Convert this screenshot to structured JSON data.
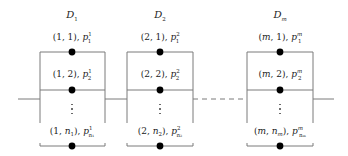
{
  "diagram": {
    "type": "parallel-series system",
    "line_color": "#7a7a7a",
    "node_color": "#000000",
    "connector_between_2_and_m": "dashed",
    "groups": [
      {
        "title": "D",
        "title_sub": "1",
        "center_x": 72,
        "left_x": 40,
        "right_x": 105,
        "rows": [
          {
            "pre": "(1, 1), ",
            "p": "p",
            "sup": "1",
            "sub": "1"
          },
          {
            "pre": "(1, 2), ",
            "p": "p",
            "sup": "1",
            "sub": "2"
          },
          {
            "pre": "(1, ",
            "n": "n",
            "n_sub": "1",
            "mid": "), ",
            "p": "p",
            "sup": "1",
            "sub": "n₁"
          }
        ]
      },
      {
        "title": "D",
        "title_sub": "2",
        "center_x": 160,
        "left_x": 127,
        "right_x": 193,
        "rows": [
          {
            "pre": "(2, 1), ",
            "p": "p",
            "sup": "2",
            "sub": "1"
          },
          {
            "pre": "(2, 2), ",
            "p": "p",
            "sup": "2",
            "sub": "2"
          },
          {
            "pre": "(2, ",
            "n": "n",
            "n_sub": "2",
            "mid": "), ",
            "p": "p",
            "sup": "2",
            "sub": "n₂"
          }
        ]
      },
      {
        "title": "D",
        "title_sub": "m",
        "center_x": 280,
        "left_x": 247,
        "right_x": 313,
        "rows": [
          {
            "pre": "(m, 1), ",
            "p": "p",
            "sup": "m",
            "sub": "1"
          },
          {
            "pre": "(m, 2), ",
            "p": "p",
            "sup": "m",
            "sub": "2"
          },
          {
            "pre": "(m, ",
            "n": "n",
            "n_sub": "m",
            "mid": "), ",
            "p": "p",
            "sup": "m",
            "sub": "nₘ"
          }
        ]
      }
    ],
    "layout": {
      "title_y": 15,
      "row1_label_y": 37,
      "row1_y": 52,
      "row2_label_y": 74,
      "row2_y": 90,
      "main_line_y": 99,
      "dots_y": 104,
      "box_bottom_y": 123,
      "rowN_label_y": 131,
      "rowN_y": 146,
      "input_x": 18,
      "output_x": 334
    }
  }
}
